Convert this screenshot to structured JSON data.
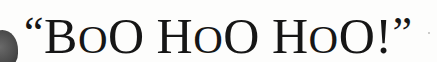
{
  "text": {
    "open_quote": "“",
    "words": [
      {
        "first": "B",
        "second": "O",
        "third": "O"
      },
      {
        "first": "H",
        "second": "O",
        "third": "O"
      },
      {
        "first": "H",
        "second": "O",
        "third": "O"
      }
    ],
    "exclaim": "!",
    "close_quote": "”"
  }
}
